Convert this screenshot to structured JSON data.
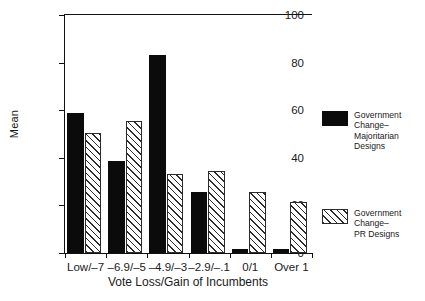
{
  "chart_data": {
    "type": "bar",
    "title": "",
    "xlabel": "Vote Loss/Gain of Incumbents",
    "ylabel": "Mean",
    "ylim": [
      0,
      100
    ],
    "yticks": [
      0,
      20,
      40,
      60,
      80,
      100
    ],
    "ytick_labels": [
      "0",
      "20",
      "40",
      "60",
      "80",
      "100"
    ],
    "grid": false,
    "legend_position": "right",
    "categories": [
      "Low/–7",
      "–6.9/–5",
      "–4.9/–3",
      "–2.9/–.1",
      "0/1",
      "Over 1"
    ],
    "series": [
      {
        "name": "Government Change–Majoritarian Designs",
        "style": "solid-black",
        "values": [
          59,
          38.8,
          83.3,
          25.8,
          1.8,
          1.8
        ]
      },
      {
        "name": "Government Change–PR Designs",
        "style": "diagonal-hatch",
        "values": [
          50.6,
          55.4,
          33,
          34.4,
          25.5,
          21.6
        ]
      }
    ]
  },
  "legend": {
    "entries": [
      {
        "label": "Government\nChange–\nMajoritarian\nDesigns",
        "swatch": "solid-black"
      },
      {
        "label": "Government\nChange–\nPR Designs",
        "swatch": "diagonal-hatch"
      }
    ]
  },
  "colors": {
    "series_majoritarian": "#0b0b0b",
    "series_pr": "#2b2b2b",
    "axis": "#111111",
    "background": "#ffffff"
  }
}
